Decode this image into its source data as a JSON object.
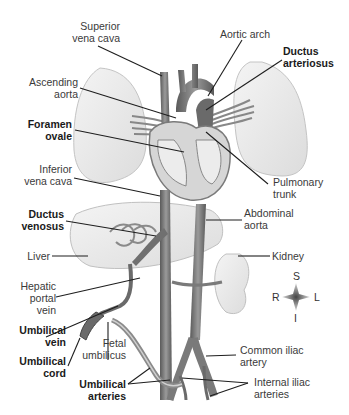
{
  "figure": {
    "labels": {
      "superior_vena_cava": [
        "Superior",
        "vena cava"
      ],
      "aortic_arch": [
        "Aortic arch"
      ],
      "ductus_arteriosus": [
        "Ductus",
        "arteriosus"
      ],
      "ascending_aorta": [
        "Ascending",
        "aorta"
      ],
      "foramen_ovale": [
        "Foramen",
        "ovale"
      ],
      "inferior_vena_cava": [
        "Inferior",
        "vena cava"
      ],
      "pulmonary_trunk": [
        "Pulmonary",
        "trunk"
      ],
      "ductus_venosus": [
        "Ductus",
        "venosus"
      ],
      "abdominal_aorta": [
        "Abdominal",
        "aorta"
      ],
      "liver": [
        "Liver"
      ],
      "kidney": [
        "Kidney"
      ],
      "hepatic_portal_vein": [
        "Hepatic",
        "portal",
        "vein"
      ],
      "umbilical_vein": [
        "Umbilical",
        "vein"
      ],
      "umbilical_cord": [
        "Umbilical",
        "cord"
      ],
      "fetal_umbilicus": [
        "Fetal",
        "umbilicus"
      ],
      "common_iliac_artery": [
        "Common iliac",
        "artery"
      ],
      "umbilical_arteries": [
        "Umbilical",
        "arteries"
      ],
      "internal_iliac_arteries": [
        "Internal iliac",
        "arteries"
      ]
    },
    "emphasized_structures": [
      "Ductus arteriosus",
      "Foramen ovale",
      "Ductus venosus",
      "Umbilical vein",
      "Umbilical cord",
      "Umbilical arteries"
    ],
    "compass": {
      "superior": "S",
      "inferior": "I",
      "right": "R",
      "left": "L"
    },
    "colors": {
      "organ_fill": "#ececec",
      "organ_edge": "#bdbdbd",
      "vessel": "#7a7a7a",
      "vessel_dark": "#555555",
      "leader_line": "#1e1e1e",
      "label_text": "#3a3a3a",
      "label_bold": "#1a1a1a"
    }
  }
}
